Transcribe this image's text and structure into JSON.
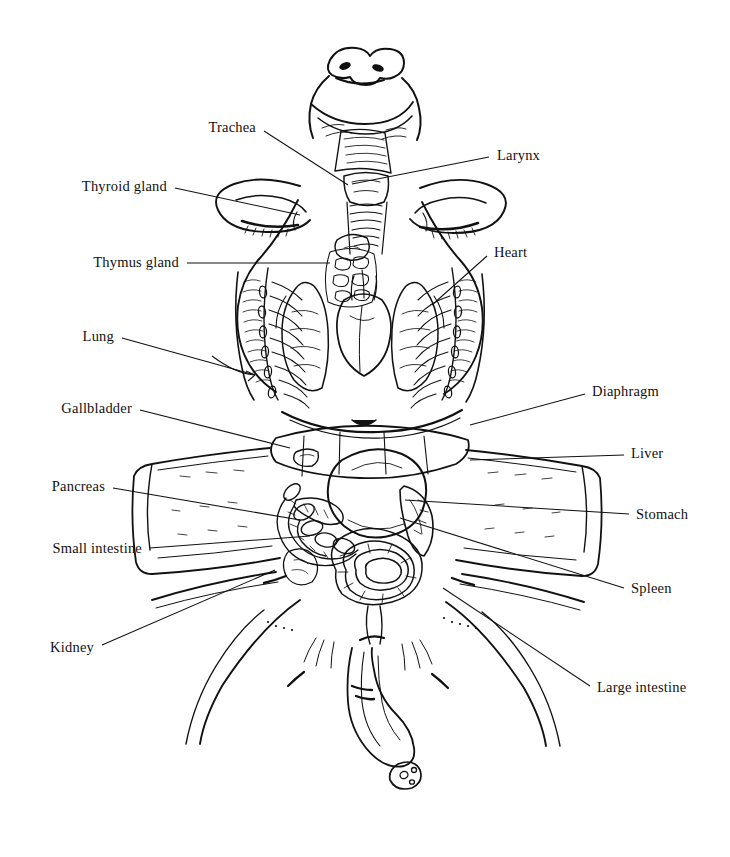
{
  "figure": {
    "style": "pen-and-ink line drawing",
    "ink_color": "#111111",
    "background_color": "#ffffff"
  },
  "labels": [
    {
      "id": "trachea",
      "text": "Trachea",
      "side": "left",
      "x": 256,
      "y": 127,
      "leader": [
        [
          264,
          131
        ],
        [
          348,
          185
        ]
      ]
    },
    {
      "id": "larynx",
      "text": "Larynx",
      "side": "right",
      "x": 497,
      "y": 155,
      "leader": [
        [
          489,
          157
        ],
        [
          352,
          184
        ]
      ]
    },
    {
      "id": "thyroid-gland",
      "text": "Thyroid gland",
      "side": "left",
      "x": 167,
      "y": 186,
      "leader": [
        [
          175,
          188
        ],
        [
          300,
          215
        ]
      ]
    },
    {
      "id": "thymus-gland",
      "text": "Thymus gland",
      "side": "left",
      "x": 179,
      "y": 262,
      "leader": [
        [
          187,
          263
        ],
        [
          330,
          263
        ]
      ]
    },
    {
      "id": "heart",
      "text": "Heart",
      "side": "right",
      "x": 494,
      "y": 252,
      "leader": [
        [
          487,
          256
        ],
        [
          432,
          305
        ]
      ]
    },
    {
      "id": "lung",
      "text": "Lung",
      "side": "left",
      "x": 114,
      "y": 336,
      "leader": [
        [
          122,
          338
        ],
        [
          255,
          375
        ]
      ]
    },
    {
      "id": "diaphragm",
      "text": "Diaphragm",
      "side": "right",
      "x": 592,
      "y": 391,
      "leader": [
        [
          585,
          394
        ],
        [
          470,
          425
        ]
      ]
    },
    {
      "id": "gallbladder",
      "text": "Gallbladder",
      "side": "left",
      "x": 132,
      "y": 408,
      "leader": [
        [
          140,
          410
        ],
        [
          290,
          448
        ]
      ]
    },
    {
      "id": "liver",
      "text": "Liver",
      "side": "right",
      "x": 631,
      "y": 453,
      "leader": [
        [
          624,
          455
        ],
        [
          470,
          460
        ]
      ]
    },
    {
      "id": "pancreas",
      "text": "Pancreas",
      "side": "left",
      "x": 105,
      "y": 486,
      "leader": [
        [
          113,
          488
        ],
        [
          300,
          520
        ]
      ]
    },
    {
      "id": "stomach",
      "text": "Stomach",
      "side": "right",
      "x": 636,
      "y": 514,
      "leader": [
        [
          629,
          514
        ],
        [
          405,
          500
        ]
      ]
    },
    {
      "id": "small-intestine",
      "text": "Small intestine",
      "side": "left",
      "x": 142,
      "y": 548,
      "leader": [
        [
          150,
          548
        ],
        [
          310,
          536
        ]
      ]
    },
    {
      "id": "spleen",
      "text": "Spleen",
      "side": "right",
      "x": 631,
      "y": 588,
      "leader": [
        [
          624,
          588
        ],
        [
          400,
          518
        ]
      ]
    },
    {
      "id": "kidney",
      "text": "Kidney",
      "side": "left",
      "x": 94,
      "y": 647,
      "leader": [
        [
          102,
          645
        ],
        [
          275,
          570
        ]
      ]
    },
    {
      "id": "large-intestine",
      "text": "Large intestine",
      "side": "right",
      "x": 597,
      "y": 687,
      "leader": [
        [
          590,
          686
        ],
        [
          443,
          588
        ]
      ]
    }
  ]
}
